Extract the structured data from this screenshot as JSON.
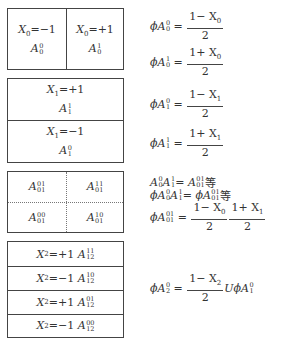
{
  "box0": {
    "left_cell": {
      "var": "X",
      "sub": "0",
      "rel": "=−1",
      "a_sup": "0",
      "a_sub": "0"
    },
    "right_cell": {
      "var": "X",
      "sub": "0",
      "rel": "=+1",
      "a_sup": "1",
      "a_sub": "0"
    }
  },
  "box1": {
    "top_cell": {
      "var": "X",
      "sub": "1",
      "rel": "=+1",
      "a_sup": "1",
      "a_sub": "1"
    },
    "bottom_cell": {
      "var": "X",
      "sub": "1",
      "rel": "=−1",
      "a_sup": "0",
      "a_sub": "1"
    }
  },
  "box2": {
    "cells": [
      {
        "a_sup": "01",
        "a_sub": "01"
      },
      {
        "a_sup": "11",
        "a_sub": "01"
      },
      {
        "a_sup": "00",
        "a_sub": "01"
      },
      {
        "a_sup": "10",
        "a_sub": "01"
      }
    ]
  },
  "box3": {
    "rows": [
      {
        "var": "X",
        "sub": "2",
        "rel": "=+1",
        "a_sup": "11",
        "a_sub": "12"
      },
      {
        "var": "X",
        "sub": "2",
        "rel": "=−1",
        "a_sup": "10",
        "a_sub": "12"
      },
      {
        "var": "X",
        "sub": "2",
        "rel": "=+1",
        "a_sup": "01",
        "a_sub": "12"
      },
      {
        "var": "X",
        "sub": "2",
        "rel": "=−1",
        "a_sup": "00",
        "a_sub": "12"
      }
    ]
  },
  "equations": {
    "eq0": {
      "lhs_prefix": "ϕA",
      "sup": "0",
      "sub": "0",
      "num": "1− X",
      "num_sub": "0",
      "den": "2"
    },
    "eq1": {
      "lhs_prefix": "ϕA",
      "sup": "1",
      "sub": "0",
      "num": "1+ X",
      "num_sub": "0",
      "den": "2"
    },
    "eq2": {
      "lhs_prefix": "ϕA",
      "sup": "0",
      "sub": "1",
      "num": "1− X",
      "num_sub": "1",
      "den": "2"
    },
    "eq3": {
      "lhs_prefix": "ϕA",
      "sup": "1",
      "sub": "1",
      "num": "1+ X",
      "num_sub": "1",
      "den": "2"
    },
    "eq4_line1": {
      "text_a": "A",
      "a_sup": "0",
      "a_sub": "0",
      "text_b": "A",
      "b_sup": "1",
      "b_sub": "1",
      "eq": "= A",
      "c_sup": "01",
      "c_sub": "01",
      "suffix": " 等"
    },
    "eq4_line2": {
      "text_a": "ϕA",
      "a_sup": "0",
      "a_sub": "0",
      "text_b": "A",
      "b_sup": "1",
      "b_sub": "1",
      "eq": "= ϕA",
      "c_sup": "01",
      "c_sub": "01",
      "suffix": " 等"
    },
    "eq4_line3": {
      "lhs": "ϕA",
      "sup": "01",
      "sub": "01",
      "num1": "1− X",
      "num1_sub": "0",
      "den1": "2",
      "num2": "1+ X",
      "num2_sub": "1",
      "den2": "2"
    },
    "eq5": {
      "lhs": "ϕA",
      "sup": "0",
      "sub": "2",
      "num": "1− X",
      "num_sub": "2",
      "den": "2",
      "tail": "UϕA",
      "tail_sup": "0",
      "tail_sub": "1"
    }
  }
}
